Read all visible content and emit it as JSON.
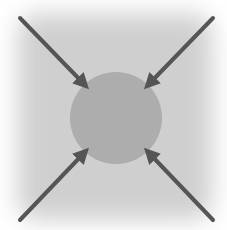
{
  "diagram": {
    "title": "",
    "colors": {
      "background": "#cfcfcf",
      "circle": "#a9a9a9",
      "arrow": "#555555"
    },
    "center_node": {
      "label": "",
      "shape": "circle"
    },
    "arrows": [
      {
        "from": "top-left",
        "to": "center"
      },
      {
        "from": "top-right",
        "to": "center"
      },
      {
        "from": "bottom-left",
        "to": "center"
      },
      {
        "from": "bottom-right",
        "to": "center"
      }
    ]
  }
}
